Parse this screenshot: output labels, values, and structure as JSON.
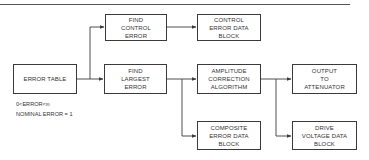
{
  "diagram": {
    "type": "flowchart",
    "colors": {
      "line": "#3a3a3a",
      "rule": "#555555",
      "background": "#ffffff",
      "text": "#333333"
    },
    "nodes": [
      {
        "id": "error_table",
        "label": "ERROR TABLE",
        "x": 13,
        "y": 64,
        "w": 64,
        "h": 30
      },
      {
        "id": "find_control_error",
        "label": "FIND\nCONTROL\nERROR",
        "x": 105,
        "y": 14,
        "w": 62,
        "h": 27
      },
      {
        "id": "find_largest_error",
        "label": "FIND\nLARGEST\nERROR",
        "x": 104,
        "y": 64,
        "w": 63,
        "h": 30
      },
      {
        "id": "control_error_data_block",
        "label": "CONTROL\nERROR DATA\nBLOCK",
        "x": 197,
        "y": 14,
        "w": 64,
        "h": 27
      },
      {
        "id": "amplitude_correction_algorithm",
        "label": "AMPLITUDE\nCORRECTION\nALGORITHM",
        "x": 197,
        "y": 64,
        "w": 64,
        "h": 30
      },
      {
        "id": "output_to_attenuator",
        "label": "OUTPUT\nTO\nATTENUATOR",
        "x": 292,
        "y": 64,
        "w": 65,
        "h": 30
      },
      {
        "id": "composite_error_data_block",
        "label": "COMPOSITE\nERROR DATA\nBLOCK",
        "x": 197,
        "y": 121,
        "w": 64,
        "h": 29
      },
      {
        "id": "drive_voltage_data_block",
        "label": "DRIVE\nVOLTAGE DATA\nBLOCK",
        "x": 292,
        "y": 121,
        "w": 65,
        "h": 29
      }
    ],
    "edges": [
      {
        "from": "error_table",
        "to": "find_control_error"
      },
      {
        "from": "error_table",
        "to": "find_largest_error"
      },
      {
        "from": "find_control_error",
        "to": "control_error_data_block"
      },
      {
        "from": "find_largest_error",
        "to": "amplitude_correction_algorithm"
      },
      {
        "from": "find_largest_error",
        "to": "composite_error_data_block"
      },
      {
        "from": "amplitude_correction_algorithm",
        "to": "output_to_attenuator"
      },
      {
        "from": "amplitude_correction_algorithm",
        "to": "drive_voltage_data_block"
      }
    ],
    "annotations": {
      "range": "0<ERROR<∞",
      "nominal": "NOMINAL ERROR = 1"
    }
  }
}
